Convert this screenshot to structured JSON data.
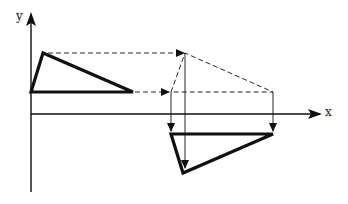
{
  "diagram": {
    "type": "geometric-transformation",
    "axes": {
      "x_label": "x",
      "y_label": "y"
    },
    "original_triangle": {
      "vertices": [
        [
          31,
          92
        ],
        [
          43,
          53
        ],
        [
          133,
          92
        ]
      ]
    },
    "intermediate_triangle_dashed": {
      "vertices": [
        [
          171,
          92
        ],
        [
          185,
          53
        ],
        [
          273,
          92
        ]
      ]
    },
    "reflected_triangle": {
      "vertices": [
        [
          171,
          134
        ],
        [
          273,
          134
        ],
        [
          183,
          173
        ]
      ]
    },
    "colors": {
      "stroke": "#111111",
      "background": "#ffffff"
    }
  }
}
